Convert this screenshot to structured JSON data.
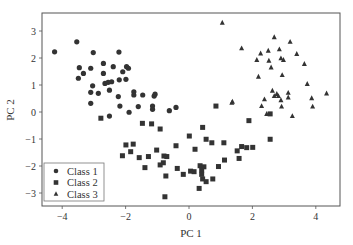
{
  "chart_data": {
    "type": "scatter",
    "title": "",
    "xlabel": "PC 1",
    "ylabel": "PC 2",
    "xlim": [
      -4.6,
      4.8
    ],
    "ylim": [
      -3.5,
      3.65
    ],
    "xticks": [
      -4,
      -2,
      0,
      2,
      4
    ],
    "yticks": [
      -3,
      -2,
      -1,
      0,
      1,
      2,
      3
    ],
    "xtick_labels": [
      "−4",
      "−2",
      "0",
      "2",
      "4"
    ],
    "ytick_labels": [
      "−3",
      "−2",
      "−1",
      "0",
      "1",
      "2",
      "3"
    ],
    "grid": false,
    "legend_position": "lower left",
    "marker_color": "#333333",
    "series": [
      {
        "name": "Class 1",
        "marker": "circle",
        "points": [
          [
            -4.24,
            2.23
          ],
          [
            -3.54,
            2.6
          ],
          [
            -3.02,
            2.2
          ],
          [
            -2.21,
            2.22
          ],
          [
            -3.46,
            1.64
          ],
          [
            -3.33,
            1.43
          ],
          [
            -3.49,
            1.25
          ],
          [
            -3.1,
            1.62
          ],
          [
            -2.7,
            1.8
          ],
          [
            -2.7,
            1.43
          ],
          [
            -2.39,
            1.68
          ],
          [
            -2.09,
            1.49
          ],
          [
            -1.97,
            1.68
          ],
          [
            -1.91,
            1.62
          ],
          [
            -3.04,
            0.97
          ],
          [
            -2.65,
            1.06
          ],
          [
            -2.55,
            1.1
          ],
          [
            -2.44,
            1.12
          ],
          [
            -2.2,
            1.19
          ],
          [
            -1.99,
            1.21
          ],
          [
            -3.1,
            0.73
          ],
          [
            -2.86,
            0.69
          ],
          [
            -2.51,
            0.81
          ],
          [
            -2.23,
            0.57
          ],
          [
            -1.74,
            0.75
          ],
          [
            -1.74,
            0.63
          ],
          [
            -1.46,
            0.63
          ],
          [
            -3.1,
            0.32
          ],
          [
            -2.18,
            0.22
          ],
          [
            -1.6,
            0.2
          ],
          [
            -1.1,
            0.59
          ],
          [
            -1.07,
            0.66
          ],
          [
            -1.15,
            0.22
          ],
          [
            -1.15,
            0.1
          ],
          [
            -1.89,
            -0.01
          ],
          [
            -0.62,
            0.05
          ],
          [
            -0.41,
            0.17
          ],
          [
            -2.51,
            -0.15
          ]
        ]
      },
      {
        "name": "Class 2",
        "marker": "square",
        "points": [
          [
            -2.78,
            -0.23
          ],
          [
            -1.47,
            -0.42
          ],
          [
            -1.18,
            -0.44
          ],
          [
            -0.91,
            -0.63
          ],
          [
            0.43,
            -0.57
          ],
          [
            0.85,
            0.22
          ],
          [
            0.01,
            -0.89
          ],
          [
            0.54,
            -1.01
          ],
          [
            0.72,
            -1.14
          ],
          [
            1.1,
            -1.14
          ],
          [
            -1.99,
            -1.22
          ],
          [
            -1.76,
            -1.19
          ],
          [
            -1.84,
            -1.47
          ],
          [
            -2.1,
            -1.62
          ],
          [
            -0.41,
            -1.25
          ],
          [
            -1.02,
            -1.41
          ],
          [
            0.19,
            -1.38
          ],
          [
            -1.57,
            -1.69
          ],
          [
            -1.28,
            -1.65
          ],
          [
            -0.79,
            -1.63
          ],
          [
            -0.7,
            -1.65
          ],
          [
            -0.81,
            -1.88
          ],
          [
            -0.91,
            -1.96
          ],
          [
            -1.39,
            -2.06
          ],
          [
            1.52,
            -1.44
          ],
          [
            1.66,
            -1.28
          ],
          [
            1.82,
            -1.32
          ],
          [
            2.01,
            -1.31
          ],
          [
            1.12,
            -1.78
          ],
          [
            1.58,
            -1.72
          ],
          [
            0.93,
            -2.02
          ],
          [
            0.35,
            -1.99
          ],
          [
            0.47,
            -2.03
          ],
          [
            -0.37,
            -2.09
          ],
          [
            -0.18,
            -2.31
          ],
          [
            0.05,
            -2.19
          ],
          [
            0.16,
            -2.21
          ],
          [
            0.4,
            -2.15
          ],
          [
            0.4,
            -2.31
          ],
          [
            0.43,
            -2.48
          ],
          [
            0.54,
            -2.58
          ],
          [
            0.75,
            -2.48
          ],
          [
            0.32,
            -2.83
          ],
          [
            -0.73,
            -2.37
          ],
          [
            -0.76,
            -3.14
          ],
          [
            1.89,
            -0.32
          ],
          [
            2.56,
            -0.07
          ],
          [
            2.56,
            -1.01
          ]
        ]
      },
      {
        "name": "Class 3",
        "marker": "triangle",
        "points": [
          [
            1.05,
            3.31
          ],
          [
            1.66,
            2.36
          ],
          [
            2.69,
            2.77
          ],
          [
            3.19,
            2.6
          ],
          [
            2.26,
            2.17
          ],
          [
            2.5,
            2.27
          ],
          [
            2.85,
            2.32
          ],
          [
            3.4,
            2.15
          ],
          [
            2.14,
            1.93
          ],
          [
            2.52,
            1.9
          ],
          [
            2.9,
            1.99
          ],
          [
            2.98,
            1.93
          ],
          [
            3.64,
            1.78
          ],
          [
            2.59,
            1.65
          ],
          [
            2.19,
            1.31
          ],
          [
            2.94,
            1.37
          ],
          [
            3.73,
            1.04
          ],
          [
            4.34,
            0.69
          ],
          [
            2.63,
            0.79
          ],
          [
            2.77,
            0.67
          ],
          [
            2.82,
            0.59
          ],
          [
            2.69,
            0.59
          ],
          [
            3.13,
            0.71
          ],
          [
            3.13,
            0.54
          ],
          [
            2.9,
            0.44
          ],
          [
            2.38,
            0.47
          ],
          [
            3.87,
            0.51
          ],
          [
            1.37,
            0.38
          ],
          [
            1.35,
            0.34
          ],
          [
            2.29,
            0.22
          ],
          [
            2.92,
            0.2
          ],
          [
            3.9,
            0.2
          ],
          [
            3.26,
            -0.15
          ],
          [
            2.45,
            -0.07
          ]
        ]
      }
    ]
  },
  "legend": {
    "items": [
      {
        "label": "Class 1",
        "marker": "circle"
      },
      {
        "label": "Class 2",
        "marker": "square"
      },
      {
        "label": "Class 3",
        "marker": "triangle"
      }
    ]
  }
}
